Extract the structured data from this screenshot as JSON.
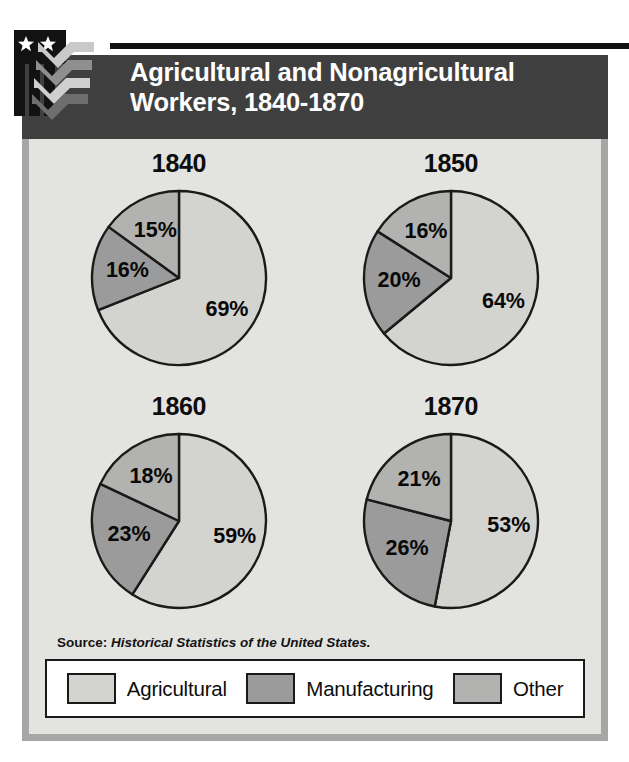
{
  "figure": {
    "title_line1": "Agricultural and Nonagricultural",
    "title_line2": "Workers, 1840-1870",
    "title_full": "Agricultural and Nonagricultural Workers, 1840-1870",
    "source_prefix": "Source:",
    "source_title": "Historical Statistics of the United States.",
    "logo_name": "stars-and-stripes-chevron-logo"
  },
  "colors": {
    "title_bar": "#3f3f3f",
    "title_text": "#ffffff",
    "panel_background": "#e3e3e0",
    "panel_border": "#a6a6a6",
    "legend_background": "#ffffff",
    "outline": "#1a1a1a",
    "agricultural": "#d3d3d0",
    "manufacturing": "#9b9b9b",
    "other": "#b2b2b0"
  },
  "legend": {
    "position": "bottom",
    "items": [
      {
        "label": "Agricultural",
        "color": "#d3d3d0"
      },
      {
        "label": "Manufacturing",
        "color": "#9b9b9b"
      },
      {
        "label": "Other",
        "color": "#b2b2b0"
      }
    ]
  },
  "chart_data": {
    "type": "pie",
    "title": "Agricultural and Nonagricultural Workers, 1840-1870",
    "xlabel": "",
    "ylabel": "",
    "unit": "percent",
    "legend_position": "bottom",
    "grid": false,
    "categories": [
      "Agricultural",
      "Manufacturing",
      "Other"
    ],
    "panels": [
      {
        "title": "1840",
        "slices": [
          {
            "label": "Agricultural",
            "value": 69,
            "display": "69%",
            "color": "#d3d3d0"
          },
          {
            "label": "Manufacturing",
            "value": 16,
            "display": "16%",
            "color": "#9b9b9b"
          },
          {
            "label": "Other",
            "value": 15,
            "display": "15%",
            "color": "#b2b2b0"
          }
        ]
      },
      {
        "title": "1850",
        "slices": [
          {
            "label": "Agricultural",
            "value": 64,
            "display": "64%",
            "color": "#d3d3d0"
          },
          {
            "label": "Manufacturing",
            "value": 20,
            "display": "20%",
            "color": "#9b9b9b"
          },
          {
            "label": "Other",
            "value": 16,
            "display": "16%",
            "color": "#b2b2b0"
          }
        ]
      },
      {
        "title": "1860",
        "slices": [
          {
            "label": "Agricultural",
            "value": 59,
            "display": "59%",
            "color": "#d3d3d0"
          },
          {
            "label": "Manufacturing",
            "value": 23,
            "display": "23%",
            "color": "#9b9b9b"
          },
          {
            "label": "Other",
            "value": 18,
            "display": "18%",
            "color": "#b2b2b0"
          }
        ]
      },
      {
        "title": "1870",
        "slices": [
          {
            "label": "Agricultural",
            "value": 53,
            "display": "53%",
            "color": "#d3d3d0"
          },
          {
            "label": "Manufacturing",
            "value": 26,
            "display": "26%",
            "color": "#9b9b9b"
          },
          {
            "label": "Other",
            "value": 21,
            "display": "21%",
            "color": "#b2b2b0"
          }
        ]
      }
    ]
  }
}
